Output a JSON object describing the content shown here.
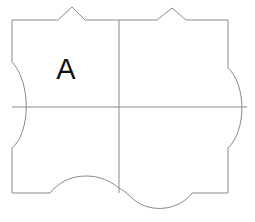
{
  "figure": {
    "name": "tessellation-tile",
    "label": "A",
    "stroke_color": "#8a8a8a",
    "fill_color": "#ffffff",
    "label_color": "#111111",
    "background_color": "#ffffff"
  },
  "geometry": {
    "bounds": {
      "left": 12,
      "top": 20,
      "right": 228,
      "bottom": 193
    },
    "center": {
      "x": 119,
      "y": 107
    },
    "outline_path": "M 12 20 L 58 20 L 72 7 L 85 20 L 119 20 L 157 20 L 172 8 L 186 20 L 228 20 L 228 68 C 246 84 247 130 228 148 L 228 193 L 192 193 C 178 212 146 214 130 196 C 126 192 122 190 119 188 C 110 181 100 176 86 176 C 70 176 58 183 50 193 L 12 193 L 12 148 C 31 132 31 82 12 62 Z",
    "divider_vertical": {
      "x1": 119,
      "y1": 20,
      "x2": 119,
      "y2": 193
    },
    "divider_horizontal": {
      "x1": 12,
      "y1": 107,
      "x2": 247,
      "y2": 107
    },
    "label_position": {
      "x": 66,
      "y": 79
    }
  },
  "edges": {
    "top": {
      "name": "top-edge",
      "description": "two triangular peaks pointing outward",
      "features": [
        {
          "type": "triangle-peak",
          "base_start_x": 58,
          "apex_x": 72,
          "apex_y": 7,
          "base_end_x": 85
        },
        {
          "type": "triangle-peak",
          "base_start_x": 157,
          "apex_x": 172,
          "apex_y": 8,
          "base_end_x": 186
        }
      ]
    },
    "left": {
      "name": "left-edge",
      "description": "concave arc curving into the tile",
      "arc_start_y": 62,
      "arc_end_y": 148,
      "arc_extent_x": 31
    },
    "right": {
      "name": "right-edge",
      "description": "convex arc bulging outward from the tile",
      "arc_start_y": 68,
      "arc_end_y": 148,
      "arc_extent_x": 247
    },
    "bottom": {
      "name": "bottom-edge",
      "description": "arc bulging inward on the left half and outward on the right half",
      "features": [
        {
          "type": "arc-inward",
          "start_x": 50,
          "end_x": 119,
          "extent_y": 176
        },
        {
          "type": "arc-outward",
          "start_x": 119,
          "end_x": 192,
          "extent_y": 211
        }
      ]
    }
  },
  "quadrants": [
    {
      "name": "quadrant-top-left",
      "label": "A"
    },
    {
      "name": "quadrant-top-right",
      "label": ""
    },
    {
      "name": "quadrant-bottom-left",
      "label": ""
    },
    {
      "name": "quadrant-bottom-right",
      "label": ""
    }
  ]
}
